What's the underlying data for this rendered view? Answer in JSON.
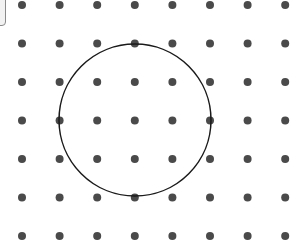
{
  "diagram": {
    "type": "dot-grid-with-circle",
    "background": "#ffffff",
    "grid": {
      "columns": 8,
      "rows": 7,
      "origin_x": 22,
      "origin_y": 5,
      "spacing_x": 37.6,
      "spacing_y": 38.5,
      "dot_radius": 4,
      "dot_color": "#4a4a4a"
    },
    "circle": {
      "cx": 135,
      "cy": 120,
      "r": 76,
      "stroke": "#1a1a1a",
      "stroke_width": 1.5
    },
    "edge_element": {
      "color": "#8a8a8a"
    }
  }
}
